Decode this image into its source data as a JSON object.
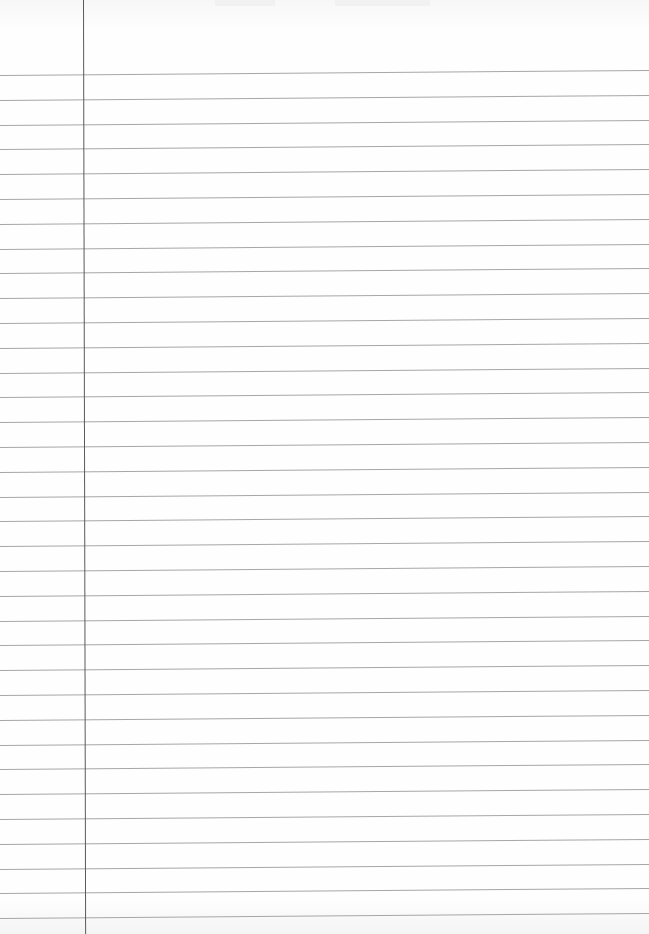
{
  "page": {
    "type": "lined-paper",
    "background_color": "#fdfdfd",
    "rule_color": "#a6a6a6",
    "margin_color": "#5a5a5a",
    "margin_x": 83,
    "first_rule_y": 75,
    "rule_spacing": 24.8,
    "rule_count": 35,
    "rule_tilt_px": -5
  }
}
